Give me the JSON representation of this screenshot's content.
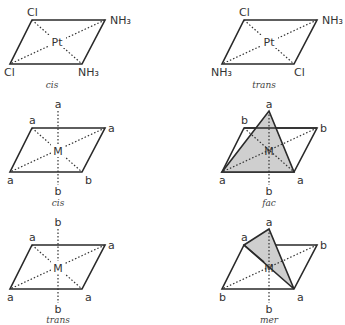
{
  "panels": [
    {
      "id": "pt-cis",
      "caption": "cis",
      "center": "Pt",
      "ligands": {
        "top_left": "Cl",
        "top_right": "NH₃",
        "bottom_left": "Cl",
        "bottom_right": "NH₃"
      }
    },
    {
      "id": "pt-trans",
      "caption": "trans",
      "center": "Pt",
      "ligands": {
        "top_left": "Cl",
        "top_right": "NH₃",
        "bottom_left": "NH₃",
        "bottom_right": "Cl"
      }
    },
    {
      "id": "oct-cis",
      "caption": "cis",
      "center": "M",
      "ligands": {
        "top": "a",
        "top_left": "a",
        "top_right": "a",
        "bottom_left": "a",
        "bottom_right": "b",
        "bottom": "b"
      }
    },
    {
      "id": "oct-fac",
      "caption": "fac",
      "center": "M",
      "ligands": {
        "top": "a",
        "top_left": "b",
        "top_right": "b",
        "bottom_left": "a",
        "bottom_right": "a",
        "bottom": "b"
      }
    },
    {
      "id": "oct-trans",
      "caption": "trans",
      "center": "M",
      "ligands": {
        "top": "b",
        "top_left": "a",
        "top_right": "a",
        "bottom_left": "a",
        "bottom_right": "a",
        "bottom": "b"
      }
    },
    {
      "id": "oct-mer",
      "caption": "mer",
      "center": "M",
      "ligands": {
        "top": "a",
        "top_left": "a",
        "top_right": "b",
        "bottom_left": "b",
        "bottom_right": "a",
        "bottom": "b"
      }
    }
  ]
}
